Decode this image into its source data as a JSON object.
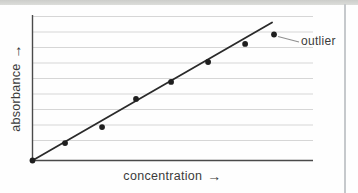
{
  "page": {
    "background": "#fefefe",
    "top_band_color": "#d3d4d1",
    "right_rule_color": "#c6c9cc"
  },
  "chart_data": {
    "type": "scatter",
    "title": "",
    "xlabel": "concentration",
    "ylabel": "absorbance",
    "x_axis_arrow": "→",
    "y_axis_arrow": "→",
    "x_range": [
      0,
      100
    ],
    "y_range": [
      0,
      100
    ],
    "axes_quantitative": false,
    "grid": "horizontal-only",
    "h_gridline_count": 9,
    "legend": "none",
    "points": [
      {
        "x": 0,
        "y": 0
      },
      {
        "x": 11.6,
        "y": 12.0
      },
      {
        "x": 24.8,
        "y": 23.0
      },
      {
        "x": 36.9,
        "y": 42.3
      },
      {
        "x": 49.4,
        "y": 54.0
      },
      {
        "x": 62.6,
        "y": 67.7
      },
      {
        "x": 75.8,
        "y": 80.1
      },
      {
        "x": 86.1,
        "y": 86.6
      }
    ],
    "outlier_point_index": 7,
    "trendline": {
      "x1": 0,
      "y1": 0,
      "x2": 85.4,
      "y2": 94.8
    },
    "annotations": [
      {
        "text": "outlier",
        "target_point_index": 7
      }
    ],
    "colors": {
      "point": "#1f1f1f",
      "trendline": "#2a2a2a",
      "axis": "#4a4a4a",
      "gridline": "#d6d6d6",
      "label_text": "#3b3b3b",
      "connector": "#8f8f8f"
    }
  }
}
